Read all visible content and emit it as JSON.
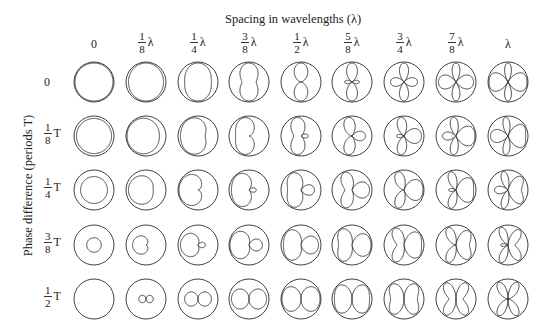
{
  "diagram": {
    "x_axis_title": "Spacing in wavelengths (λ)",
    "y_axis_title": "Phase difference (periods T)",
    "columns": [
      {
        "num": "",
        "den": "",
        "unit": "",
        "text": "0",
        "spacing": 0
      },
      {
        "num": "1",
        "den": "8",
        "unit": "λ",
        "text": "",
        "spacing": 0.125
      },
      {
        "num": "1",
        "den": "4",
        "unit": "λ",
        "text": "",
        "spacing": 0.25
      },
      {
        "num": "3",
        "den": "8",
        "unit": "λ",
        "text": "",
        "spacing": 0.375
      },
      {
        "num": "1",
        "den": "2",
        "unit": "λ",
        "text": "",
        "spacing": 0.5
      },
      {
        "num": "5",
        "den": "8",
        "unit": "λ",
        "text": "",
        "spacing": 0.625
      },
      {
        "num": "3",
        "den": "4",
        "unit": "λ",
        "text": "",
        "spacing": 0.75
      },
      {
        "num": "7",
        "den": "8",
        "unit": "λ",
        "text": "",
        "spacing": 0.875
      },
      {
        "num": "",
        "den": "",
        "unit": "",
        "text": "λ",
        "spacing": 1.0
      }
    ],
    "rows": [
      {
        "num": "",
        "den": "",
        "unit": "",
        "text": "0",
        "phase": 0
      },
      {
        "num": "1",
        "den": "8",
        "unit": "T",
        "text": "",
        "phase": 0.125
      },
      {
        "num": "1",
        "den": "4",
        "unit": "T",
        "text": "",
        "phase": 0.25
      },
      {
        "num": "3",
        "den": "8",
        "unit": "T",
        "text": "",
        "phase": 0.375
      },
      {
        "num": "1",
        "den": "2",
        "unit": "T",
        "text": "",
        "phase": 0.5
      }
    ],
    "layout": {
      "col_x": [
        94,
        146,
        198,
        249,
        301,
        352,
        404,
        456,
        508
      ],
      "row_y": [
        82,
        136,
        190,
        245,
        299
      ],
      "radius": 20
    },
    "colors": {
      "line": "#2a2a2a",
      "background": "#ffffff"
    }
  }
}
